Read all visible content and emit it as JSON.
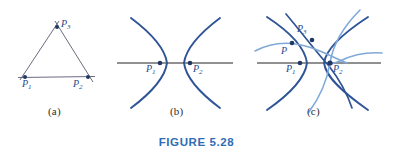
{
  "figure": {
    "caption": "FIGURE 5.28",
    "caption_color": "#2e6db4",
    "background_color": "#ffffff",
    "curve_color": "#2f5596",
    "curve_color_light": "#7fa9d8",
    "axis_color": "#6b6b6b",
    "triangle_edge_color": "#5a5a6e",
    "point_color": "#1f3864",
    "label_color": "#2b4a8b"
  },
  "panels": [
    {
      "id": "a",
      "label": "(a)",
      "description": "triangle with three labeled vertices",
      "points": [
        {
          "name": "P1",
          "label": "P",
          "sub": "1",
          "x": 25,
          "y": 77,
          "label_x": 22,
          "label_y": 79
        },
        {
          "name": "P2",
          "label": "P",
          "sub": "2",
          "x": 88,
          "y": 77,
          "label_x": 73,
          "label_y": 79
        },
        {
          "name": "P3",
          "label": "P",
          "sub": "3",
          "x": 57,
          "y": 27,
          "label_x": 61,
          "label_y": 20
        }
      ]
    },
    {
      "id": "b",
      "label": "(b)",
      "description": "two hyperbola branches opening away from each other with foci on a horizontal line",
      "points": [
        {
          "name": "P1",
          "label": "P",
          "sub": "1",
          "x": 160,
          "y": 63,
          "label_x": 146,
          "label_y": 64
        },
        {
          "name": "P2",
          "label": "P",
          "sub": "2",
          "x": 190,
          "y": 63,
          "label_x": 193,
          "label_y": 64
        }
      ]
    },
    {
      "id": "c",
      "label": "(c)",
      "description": "overlapping families of hyperbolas with an intersection point P",
      "points": [
        {
          "name": "P",
          "label": "P",
          "sub": "",
          "x": 292,
          "y": 43,
          "label_x": 282,
          "label_y": 46
        },
        {
          "name": "P1",
          "label": "P",
          "sub": "1",
          "x": 300,
          "y": 63,
          "label_x": 286,
          "label_y": 64
        },
        {
          "name": "P2",
          "label": "P",
          "sub": "2",
          "x": 330,
          "y": 63,
          "label_x": 333,
          "label_y": 64
        },
        {
          "name": "P3",
          "label": "P",
          "sub": "3",
          "x": 312,
          "y": 40,
          "label_x": 298,
          "label_y": 25
        }
      ]
    }
  ],
  "panel_labels": [
    {
      "text": "(a)",
      "x": 48,
      "y": 108
    },
    {
      "text": "(b)",
      "x": 170,
      "y": 108
    },
    {
      "text": "(c)",
      "x": 307,
      "y": 108
    }
  ]
}
